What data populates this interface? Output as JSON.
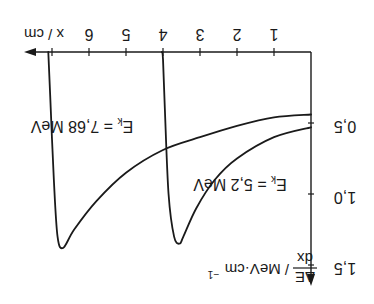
{
  "chart_data": {
    "type": "line",
    "orientation_note": "figure rendered rotated 180 degrees",
    "title": "",
    "xlabel": "x / cm",
    "ylabel": "ΔE/dx / MeV·cm⁻¹",
    "ylabel_parts": {
      "numerator": "ΔE",
      "denominator": "dx",
      "unit": "/ MeV·cm",
      "exponent": "−1"
    },
    "xlim": [
      0,
      7.3
    ],
    "ylim": [
      0,
      1.55
    ],
    "x_ticks": [
      1,
      2,
      3,
      4,
      5,
      6,
      7
    ],
    "x_tick_labels": [
      "1",
      "2",
      "3",
      "4",
      "5",
      "6"
    ],
    "y_ticks": [
      0.5,
      1.0,
      1.5
    ],
    "y_tick_labels": [
      "0,5",
      "1,0",
      "1,5"
    ],
    "grid": false,
    "legend": "none (curves labelled inline)",
    "series": [
      {
        "name": "E_k = 5,2 MeV",
        "label_main": "E",
        "label_sub": "k",
        "label_rest": " = 5,2 MeV",
        "x": [
          0,
          1,
          2,
          2.6,
          3.1,
          3.45,
          3.55,
          3.7,
          3.85,
          3.95,
          4.0,
          4.03
        ],
        "y": [
          0.53,
          0.6,
          0.75,
          0.9,
          1.1,
          1.3,
          1.35,
          1.3,
          1.0,
          0.4,
          0.05,
          0
        ]
      },
      {
        "name": "E_k = 7,68 MeV",
        "label_main": "E",
        "label_sub": "k",
        "label_rest": " = 7,68 MeV",
        "x": [
          0,
          1,
          2,
          3,
          4,
          5,
          5.8,
          6.4,
          6.7,
          6.85,
          6.95,
          7.05,
          7.1
        ],
        "y": [
          0.44,
          0.46,
          0.52,
          0.6,
          0.69,
          0.85,
          1.05,
          1.25,
          1.38,
          1.3,
          0.9,
          0.3,
          0
        ]
      }
    ]
  }
}
